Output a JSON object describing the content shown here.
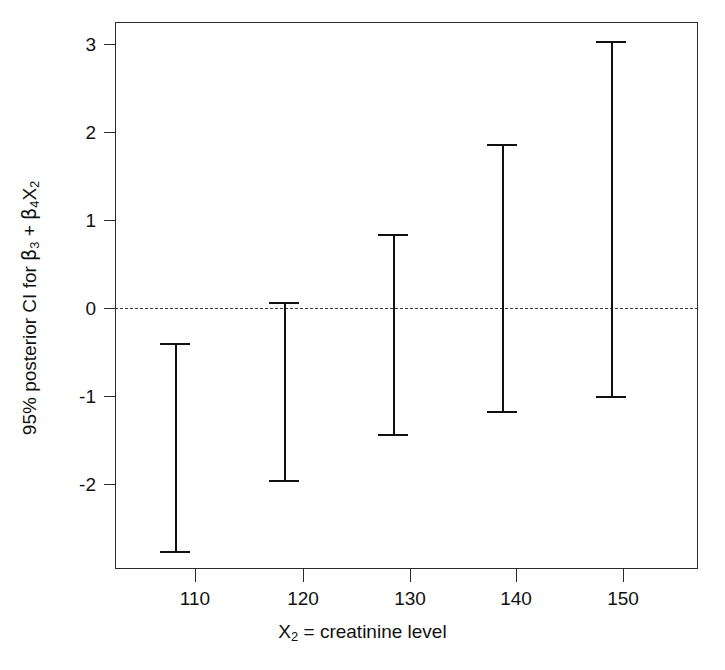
{
  "chart_data": {
    "type": "errorbar",
    "title": "",
    "xlabel": "X₂ = creatinine level",
    "ylabel": "95% posterior CI for β₃ + β₄X₂",
    "x": [
      110,
      120,
      130,
      140,
      150
    ],
    "xtick_labels": [
      "110",
      "120",
      "130",
      "140",
      "150"
    ],
    "ytick_labels": [
      "3",
      "2",
      "1",
      "0",
      "-1",
      "-2"
    ],
    "ytick_values": [
      3,
      2,
      1,
      0,
      -1,
      -2
    ],
    "xlim": [
      104.5,
      158.0
    ],
    "ylim": [
      -2.95,
      3.23
    ],
    "grid": false,
    "legend": null,
    "reference_line": {
      "y": 0,
      "style": "dashed",
      "color": "#3a3a3a"
    },
    "series": [
      {
        "name": "95% posterior CI",
        "lower": [
          -2.75,
          -1.94,
          -1.42,
          -1.17,
          -1.0
        ],
        "upper": [
          -0.4,
          0.07,
          0.83,
          1.85,
          3.02
        ]
      }
    ],
    "intervals": [
      {
        "x": 110,
        "lower": -2.75,
        "upper": -0.4
      },
      {
        "x": 120,
        "lower": -1.94,
        "upper": 0.07
      },
      {
        "x": 130,
        "lower": -1.42,
        "upper": 0.83
      },
      {
        "x": 140,
        "lower": -1.17,
        "upper": 1.85
      },
      {
        "x": 150,
        "lower": -1.0,
        "upper": 3.02
      }
    ],
    "colors": {
      "bar": "#111111",
      "frame": "#2b2b2b",
      "reference": "#3a3a3a",
      "background": "#ffffff"
    }
  },
  "axis": {
    "y_labels": [
      "3",
      "2",
      "1",
      "0",
      "-1",
      "-2"
    ],
    "x_labels": [
      "110",
      "120",
      "130",
      "140",
      "150"
    ],
    "x_title": "X₂ = creatinine level",
    "y_title_prefix": "95% posterior CI for ",
    "y_title_beta3": "β",
    "y_title_sub3": "3",
    "y_title_plus": " + ",
    "y_title_beta4": "β",
    "y_title_sub4": "4",
    "y_title_X": "X",
    "y_title_subX": "2"
  }
}
